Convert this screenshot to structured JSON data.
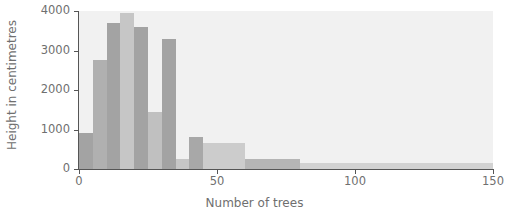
{
  "chart_data": {
    "type": "bar",
    "title": "",
    "subtitle": "",
    "xlabel": "Number of trees",
    "ylabel": "Height in centimetres",
    "xlim": [
      0,
      150
    ],
    "ylim": [
      0,
      4000
    ],
    "xticks": [
      0,
      50,
      100,
      150
    ],
    "xticklabels": [
      "0",
      "50",
      "100",
      "150"
    ],
    "yticks": [
      0,
      1000,
      2000,
      3000,
      4000
    ],
    "yticklabels": [
      "0",
      "1000",
      "2000",
      "3000",
      "4000"
    ],
    "grid": false,
    "legend": null,
    "bin_width": 5,
    "plot_background": "#f1f1f1",
    "bar_colors": [
      "#a3a3a3",
      "#c6c6c6"
    ],
    "bins": [
      {
        "x0": 0,
        "x1": 5,
        "value": 900,
        "color": "#a3a3a3"
      },
      {
        "x0": 5,
        "x1": 10,
        "value": 2750,
        "color": "#b0b0b0"
      },
      {
        "x0": 10,
        "x1": 15,
        "value": 3700,
        "color": "#a3a3a3"
      },
      {
        "x0": 15,
        "x1": 20,
        "value": 3950,
        "color": "#c6c6c6"
      },
      {
        "x0": 20,
        "x1": 25,
        "value": 3600,
        "color": "#a3a3a3"
      },
      {
        "x0": 25,
        "x1": 30,
        "value": 1450,
        "color": "#c0c0c0"
      },
      {
        "x0": 30,
        "x1": 35,
        "value": 3300,
        "color": "#a3a3a3"
      },
      {
        "x0": 35,
        "x1": 40,
        "value": 250,
        "color": "#c6c6c6"
      },
      {
        "x0": 40,
        "x1": 45,
        "value": 800,
        "color": "#a8a8a8"
      },
      {
        "x0": 45,
        "x1": 50,
        "value": 650,
        "color": "#cccccc"
      },
      {
        "x0": 50,
        "x1": 55,
        "value": 650,
        "color": "#cccccc"
      },
      {
        "x0": 55,
        "x1": 60,
        "value": 650,
        "color": "#cccccc"
      },
      {
        "x0": 60,
        "x1": 65,
        "value": 250,
        "color": "#b5b5b5"
      },
      {
        "x0": 65,
        "x1": 70,
        "value": 250,
        "color": "#b5b5b5"
      },
      {
        "x0": 70,
        "x1": 75,
        "value": 250,
        "color": "#b5b5b5"
      },
      {
        "x0": 75,
        "x1": 80,
        "value": 250,
        "color": "#b5b5b5"
      },
      {
        "x0": 80,
        "x1": 150,
        "value": 150,
        "color": "#d2d2d2"
      }
    ]
  }
}
